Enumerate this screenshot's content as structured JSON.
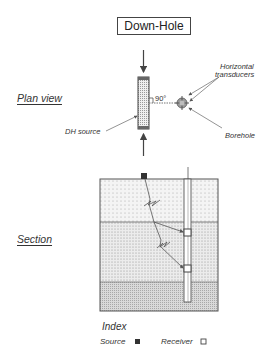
{
  "title": "Down-Hole",
  "plan_view": {
    "label": "Plan view",
    "source_label": "DH source",
    "angle_label": "90°",
    "transducers_label_line1": "Horizontal",
    "transducers_label_line2": "transducers",
    "borehole_label": "Borehole"
  },
  "section": {
    "label": "Section",
    "layers": [
      {
        "name": "upper-layer",
        "fill": "#f2f2f2"
      },
      {
        "name": "middle-layer",
        "fill": "#e9e9e9"
      },
      {
        "name": "lower-layer",
        "fill": "#d6d6d6"
      }
    ],
    "receivers": 2
  },
  "legend": {
    "title": "Index",
    "source_label": "Source",
    "receiver_label": "Receiver"
  },
  "colors": {
    "line": "#444444",
    "source_fill": "#333333"
  }
}
